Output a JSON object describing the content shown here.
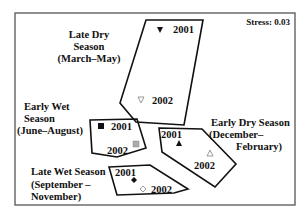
{
  "figure": {
    "type": "NMDS ordination plot",
    "stress_label": "Stress: 0.03"
  },
  "seasons": [
    {
      "name": "late-dry",
      "label_lines": [
        "Late Dry",
        "Season",
        "(March–May)"
      ],
      "points": [
        {
          "year": "2001",
          "marker": "triangle-down-filled",
          "color": "#111111"
        },
        {
          "year": "2002",
          "marker": "triangle-down-open",
          "color": "#aaaaaa"
        }
      ]
    },
    {
      "name": "early-wet",
      "label_lines": [
        "Early Wet",
        "Season",
        "(June–August)"
      ],
      "points": [
        {
          "year": "2001",
          "marker": "square-filled",
          "color": "#111111"
        },
        {
          "year": "2002",
          "marker": "square-grey",
          "color": "#aaaaaa"
        }
      ]
    },
    {
      "name": "early-dry",
      "label_lines": [
        "Early Dry Season",
        "(December–",
        "February)"
      ],
      "points": [
        {
          "year": "2001",
          "marker": "triangle-up-filled",
          "color": "#111111"
        },
        {
          "year": "2002",
          "marker": "triangle-up-open",
          "color": "#aaaaaa"
        }
      ]
    },
    {
      "name": "late-wet",
      "label_lines": [
        "Late Wet Season",
        "(September –",
        "November)"
      ],
      "points": [
        {
          "year": "2001",
          "marker": "diamond-filled",
          "color": "#111111"
        },
        {
          "year": "2002",
          "marker": "diamond-open",
          "color": "#aaaaaa"
        }
      ]
    }
  ]
}
